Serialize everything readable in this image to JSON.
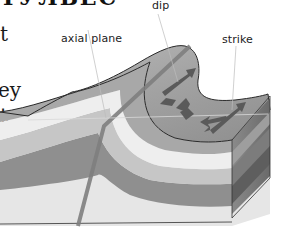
{
  "heading_fragment": "ТУЛЬЕС",
  "side_text": {
    "line1": "t",
    "line2": "ey",
    "line3": "t"
  },
  "labels": {
    "dip": "dip",
    "axial_plane": "axial plane",
    "strike": "strike"
  },
  "colors": {
    "top_surface": "#9a9a9a",
    "fold_band_light": "#ececec",
    "fold_band_mid": "#c4c4c4",
    "fold_band_dark": "#8e8e8e",
    "base_layer": "#e2e2e2",
    "arrows": "#5a5a5a",
    "axial_line": "#8a8a8a",
    "outline": "#2a2a2a"
  }
}
